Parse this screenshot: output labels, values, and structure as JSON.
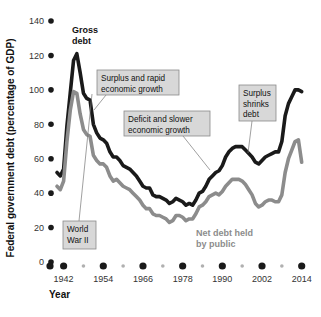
{
  "chart_data": {
    "type": "line",
    "title": "",
    "xlabel": "Year",
    "ylabel": "Federal government debt (percentage of GDP)",
    "xlim": [
      1940,
      2015
    ],
    "ylim": [
      0,
      140
    ],
    "yticks": [
      0,
      20,
      40,
      60,
      80,
      100,
      120,
      140
    ],
    "xticks": [
      1942,
      1954,
      1966,
      1978,
      1990,
      2002,
      2014
    ],
    "xminorticks": [
      1948,
      1960,
      1972,
      1984,
      1996,
      2008
    ],
    "grid": false,
    "legend_position": "inline-labels",
    "series": [
      {
        "name": "Gross debt",
        "color": "#1a1a1a",
        "x": [
          1940,
          1941,
          1942,
          1943,
          1944,
          1945,
          1946,
          1947,
          1948,
          1949,
          1950,
          1951,
          1952,
          1953,
          1954,
          1955,
          1956,
          1957,
          1958,
          1959,
          1960,
          1961,
          1962,
          1963,
          1964,
          1965,
          1966,
          1967,
          1968,
          1969,
          1970,
          1971,
          1972,
          1973,
          1974,
          1975,
          1976,
          1977,
          1978,
          1979,
          1980,
          1981,
          1982,
          1983,
          1984,
          1985,
          1986,
          1987,
          1988,
          1989,
          1990,
          1991,
          1992,
          1993,
          1994,
          1995,
          1996,
          1997,
          1998,
          1999,
          2000,
          2001,
          2002,
          2003,
          2004,
          2005,
          2006,
          2007,
          2008,
          2009,
          2010,
          2011,
          2012,
          2013,
          2014
        ],
        "values": [
          52,
          50,
          54,
          79,
          98,
          117,
          121,
          110,
          98,
          95,
          94,
          80,
          75,
          72,
          71,
          69,
          64,
          61,
          61,
          59,
          56,
          55,
          54,
          52,
          50,
          47,
          44,
          43,
          43,
          39,
          38,
          38,
          37,
          36,
          34,
          35,
          37,
          36,
          35,
          33,
          34,
          33,
          36,
          40,
          41,
          44,
          48,
          50,
          52,
          53,
          56,
          61,
          64,
          66,
          67,
          67,
          67,
          65,
          63,
          61,
          58,
          57,
          59,
          61,
          62,
          63,
          64,
          64,
          70,
          85,
          92,
          96,
          100,
          100,
          99
        ]
      },
      {
        "name": "Net debt held by public",
        "color": "#8c8c8c",
        "x": [
          1940,
          1941,
          1942,
          1943,
          1944,
          1945,
          1946,
          1947,
          1948,
          1949,
          1950,
          1951,
          1952,
          1953,
          1954,
          1955,
          1956,
          1957,
          1958,
          1959,
          1960,
          1961,
          1962,
          1963,
          1964,
          1965,
          1966,
          1967,
          1968,
          1969,
          1970,
          1971,
          1972,
          1973,
          1974,
          1975,
          1976,
          1977,
          1978,
          1979,
          1980,
          1981,
          1982,
          1983,
          1984,
          1985,
          1986,
          1987,
          1988,
          1989,
          1990,
          1991,
          1992,
          1993,
          1994,
          1995,
          1996,
          1997,
          1998,
          1999,
          2000,
          2001,
          2002,
          2003,
          2004,
          2005,
          2006,
          2007,
          2008,
          2009,
          2010,
          2011,
          2012,
          2013,
          2014
        ],
        "values": [
          44,
          42,
          47,
          70,
          88,
          99,
          98,
          86,
          77,
          74,
          73,
          62,
          59,
          57,
          57,
          55,
          50,
          47,
          48,
          46,
          44,
          43,
          42,
          40,
          38,
          36,
          33,
          31,
          31,
          28,
          27,
          27,
          26,
          25,
          23,
          24,
          27,
          27,
          26,
          24,
          25,
          25,
          28,
          32,
          33,
          35,
          38,
          39,
          40,
          39,
          41,
          44,
          46,
          48,
          48,
          48,
          47,
          45,
          42,
          39,
          34,
          32,
          33,
          35,
          36,
          36,
          35,
          35,
          39,
          52,
          60,
          65,
          70,
          71,
          58
        ]
      }
    ],
    "annotations": [
      {
        "id": "gross-debt-label",
        "text": [
          "Gross",
          "debt"
        ],
        "style": "plain-dark",
        "x": 72,
        "y": 33
      },
      {
        "id": "net-debt-label",
        "text": [
          "Net debt held",
          "by public"
        ],
        "style": "plain-gray",
        "x": 196,
        "y": 236
      },
      {
        "id": "world-war-ii-callout",
        "text": [
          "World",
          "War II"
        ],
        "style": "box",
        "box": {
          "x": 63,
          "y": 221,
          "w": 33,
          "h": 28
        },
        "leader": [
          [
            79,
            221
          ],
          [
            92,
            94
          ]
        ]
      },
      {
        "id": "surplus-rapid-growth-callout",
        "text": [
          "Surplus and rapid",
          "economic growth"
        ],
        "style": "box",
        "box": {
          "x": 97,
          "y": 70,
          "w": 82,
          "h": 25
        },
        "leader": [
          [
            106,
            95
          ],
          [
            94,
            110
          ]
        ]
      },
      {
        "id": "deficit-slower-growth-callout",
        "text": [
          "Deficit and slower",
          "economic growth"
        ],
        "style": "box",
        "box": {
          "x": 124,
          "y": 111,
          "w": 86,
          "h": 25
        },
        "leader": [
          [
            183,
            136
          ],
          [
            210,
            170
          ]
        ]
      },
      {
        "id": "surplus-shrinks-debt-callout",
        "text": [
          "Surplus",
          "shrinks",
          "debt"
        ],
        "style": "box",
        "box": {
          "x": 239,
          "y": 85,
          "w": 37,
          "h": 36
        },
        "leader": [
          [
            252,
            121
          ],
          [
            248,
            153
          ]
        ]
      }
    ]
  },
  "axis": {
    "y_title": "Federal government debt (percentage of GDP)",
    "x_title": "Year",
    "y_labels": [
      "140",
      "120",
      "100",
      "80",
      "60",
      "40",
      "20",
      "0"
    ],
    "x_labels": [
      "1942",
      "1954",
      "1966",
      "1978",
      "1990",
      "2002",
      "2014"
    ]
  },
  "colors": {
    "gross_debt": "#1a1a1a",
    "net_debt": "#8c8c8c",
    "callout_fill": "#d8d8d8",
    "callout_border": "#8a8a8a",
    "axis_dot": "#1a1a1a",
    "axis_minor_dot": "#b0b0b0",
    "text": "#111111"
  }
}
